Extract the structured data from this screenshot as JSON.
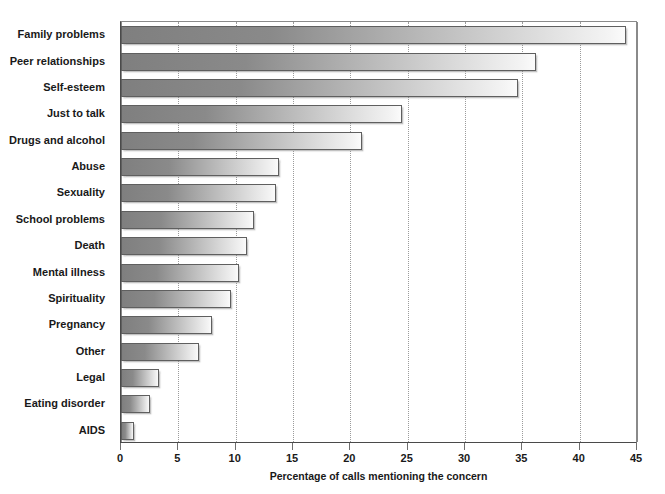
{
  "chart_data": {
    "type": "bar",
    "orientation": "horizontal",
    "title": "",
    "xlabel": "Percentage of calls mentioning the concern",
    "ylabel": "",
    "xlim": [
      0,
      45
    ],
    "xticks": [
      0,
      5,
      10,
      15,
      20,
      25,
      30,
      35,
      40,
      45
    ],
    "xtick_labels": [
      "0",
      "5",
      "10",
      "15",
      "20",
      "25",
      "30",
      "35",
      "40",
      "45"
    ],
    "grid": "vertical-dotted",
    "legend": null,
    "categories": [
      "Family problems",
      "Peer relationships",
      "Self-esteem",
      "Just to talk",
      "Drugs and alcohol",
      "Abuse",
      "Sexuality",
      "School problems",
      "Death",
      "Mental illness",
      "Spirituality",
      "Pregnancy",
      "Other",
      "Legal",
      "Eating disorder",
      "AIDS"
    ],
    "values": [
      44.0,
      36.2,
      34.6,
      24.5,
      21.0,
      13.8,
      13.5,
      11.6,
      11.0,
      10.3,
      9.6,
      7.9,
      6.8,
      3.3,
      2.5,
      1.1
    ],
    "bar_fill_start_color": "#7f7f7f",
    "bar_fill_end_color": "#fbfbfb",
    "bar_border_color": "#5f5f5f",
    "grid_color": "#9b9b9b",
    "text_color": "#191919"
  }
}
